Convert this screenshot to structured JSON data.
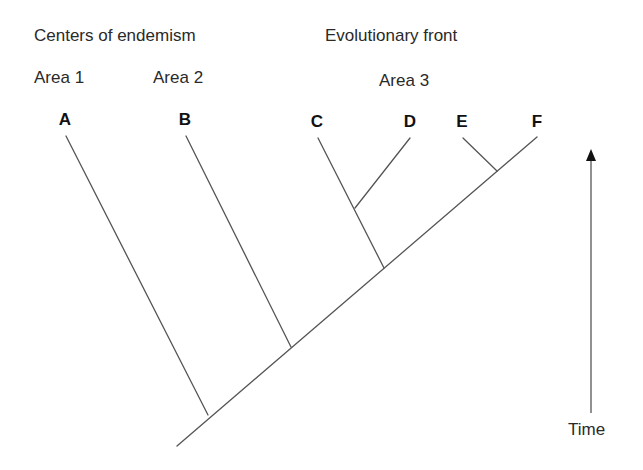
{
  "headers": {
    "left": "Centers of endemism",
    "right": "Evolutionary front"
  },
  "areas": [
    {
      "label": "Area 1"
    },
    {
      "label": "Area 2"
    },
    {
      "label": "Area 3"
    }
  ],
  "taxa": [
    "A",
    "B",
    "C",
    "D",
    "E",
    "F"
  ],
  "axis": {
    "label": "Time",
    "direction": "up"
  },
  "colors": {
    "line": "#555555",
    "text": "#222222"
  },
  "tree": {
    "topology": "(A,(B,((C,D),(E,F))))",
    "clades": [
      {
        "members": [
          "A",
          "B",
          "C",
          "D",
          "E",
          "F"
        ]
      },
      {
        "members": [
          "B",
          "C",
          "D",
          "E",
          "F"
        ]
      },
      {
        "members": [
          "C",
          "D",
          "E",
          "F"
        ]
      },
      {
        "members": [
          "C",
          "D"
        ]
      },
      {
        "members": [
          "E",
          "F"
        ]
      }
    ]
  }
}
